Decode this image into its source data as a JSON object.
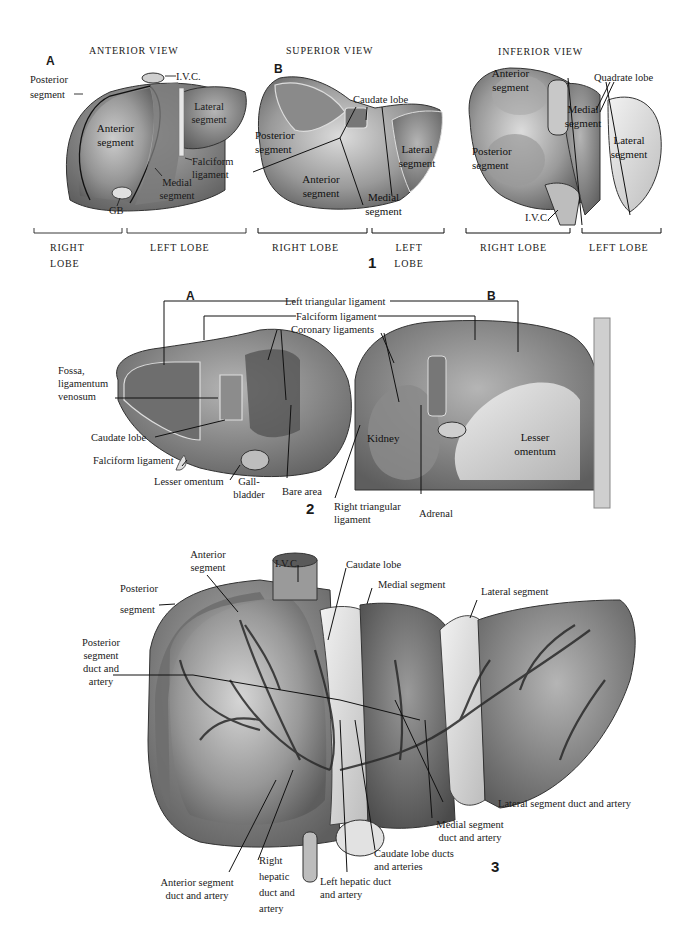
{
  "figure1": {
    "number": "1",
    "anterior": {
      "title": "ANTERIOR VIEW",
      "panel": "A",
      "labels": {
        "posterior_segment": "Posterior segment",
        "ivc": "I.V.C.",
        "lateral_segment": "Lateral segment",
        "anterior_segment": "Anterior segment",
        "falciform_ligament": "Falciform ligament",
        "medial_segment": "Medial segment",
        "gb": "GB"
      },
      "lobes": {
        "right": "RIGHT LOBE",
        "left": "LEFT LOBE"
      }
    },
    "superior": {
      "title": "SUPERIOR VIEW",
      "panel": "B",
      "labels": {
        "caudate_lobe": "Caudate lobe",
        "posterior_segment": "Posterior segment",
        "lateral_segment": "Lateral segment",
        "anterior_segment": "Anterior segment",
        "medial_segment": "Medial segment"
      },
      "lobes": {
        "right": "RIGHT LOBE",
        "left": "LEFT LOBE"
      }
    },
    "inferior": {
      "title": "INFERIOR VIEW",
      "labels": {
        "anterior_segment": "Anterior segment",
        "quadrate_lobe": "Quadrate lobe",
        "medial_segment": "Medial segment",
        "lateral_segment": "Lateral segment",
        "posterior_segment": "Posterior segment",
        "ivc": "I.V.C."
      },
      "lobes": {
        "right": "RIGHT LOBE",
        "left": "LEFT LOBE"
      }
    }
  },
  "figure2": {
    "number": "2",
    "panel_a": "A",
    "panel_b": "B",
    "labels": {
      "left_triangular_ligament": "Left triangular ligament",
      "falciform_ligament_top": "Falciform ligament",
      "coronary_ligaments": "Coronary ligaments",
      "fossa_ligamentum_venosum": "Fossa, ligamentum venosum",
      "caudate_lobe": "Caudate lobe",
      "falciform_ligament": "Falciform ligament",
      "lesser_omentum_a": "Lesser omentum",
      "gallbladder": "Gall- bladder",
      "bare_area": "Bare area",
      "right_triangular_ligament": "Right triangular ligament",
      "adrenal": "Adrenal",
      "kidney": "Kidney",
      "lesser_omentum_b": "Lesser omentum"
    }
  },
  "figure3": {
    "number": "3",
    "labels": {
      "anterior_segment": "Anterior segment",
      "ivc": "I.V.C.",
      "caudate_lobe": "Caudate lobe",
      "posterior_segment": "Posterior segment",
      "medial_segment": "Medial segment",
      "lateral_segment": "Lateral segment",
      "posterior_segment_duct": "Posterior segment duct and artery",
      "lateral_segment_duct": "Lateral segment duct and artery",
      "medial_segment_duct": "Medial segment duct and artery",
      "caudate_lobe_ducts": "Caudate lobe ducts and arteries",
      "right_hepatic_duct": "Right hepatic duct and artery",
      "left_hepatic_duct": "Left hepatic duct and artery",
      "anterior_segment_duct": "Anterior segment duct and artery"
    }
  }
}
